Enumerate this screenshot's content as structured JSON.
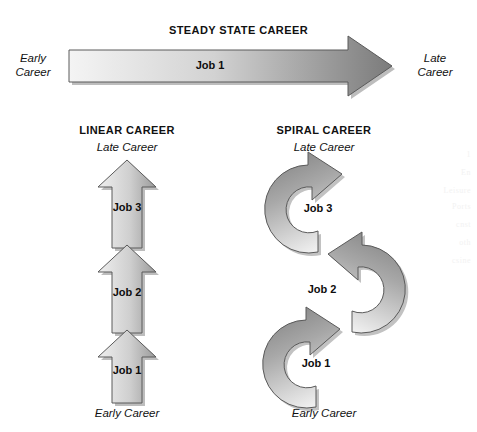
{
  "diagram": {
    "background": "#ffffff",
    "outline_color": "#555555",
    "shadow_color": "#b9b9b9",
    "gradient_light": "#f1f1f1",
    "gradient_mid": "#c8c8c8",
    "gradient_dark": "#7d7d7d"
  },
  "steady_state": {
    "title": "STEADY STATE CAREER",
    "start_label_line1": "Early",
    "start_label_line2": "Career",
    "end_label_line1": "Late",
    "end_label_line2": "Career",
    "job": "Job 1"
  },
  "linear": {
    "title": "LINEAR CAREER",
    "top_label": "Late Career",
    "bottom_label": "Early Career",
    "jobs": [
      {
        "label": "Job 3"
      },
      {
        "label": "Job 2"
      },
      {
        "label": "Job 1"
      }
    ]
  },
  "spiral": {
    "title": "SPIRAL CAREER",
    "top_label": "Late Career",
    "bottom_label": "Early Career",
    "jobs": [
      {
        "label": "Job 3"
      },
      {
        "label": "Job 2"
      },
      {
        "label": "Job 1"
      }
    ]
  },
  "bleed_text": {
    "lines": [
      "1",
      "En",
      "Leisure",
      "Ports",
      "cnst",
      "oth",
      "csine"
    ]
  }
}
